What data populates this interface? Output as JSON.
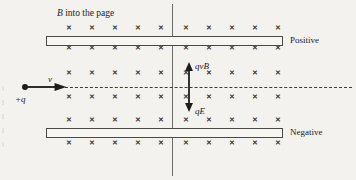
{
  "figure": {
    "background_color": "#f3f2ef",
    "ink_color": "#1d1d1b"
  },
  "labels": {
    "field_prefix": "B",
    "field_suffix": " into the page",
    "field_full": "B into the page",
    "top_plate": "Positive",
    "bottom_plate": "Negative",
    "velocity": "v",
    "charge": "+q",
    "magnetic_force": "qvB",
    "electric_force": "qE"
  },
  "field_marks": {
    "glyph": "✕",
    "symbol_name": "x-into-page-mark",
    "columns": 10,
    "rows": 6,
    "row_y": [
      28,
      48,
      73,
      97,
      120,
      143
    ],
    "column_x": [
      69,
      92,
      115,
      138,
      161,
      186,
      209,
      232,
      255,
      278
    ],
    "gap_after_column": 5
  },
  "plates": {
    "top": {
      "x": 46,
      "y": 36,
      "width": 237,
      "height": 10
    },
    "bottom": {
      "x": 46,
      "y": 128,
      "width": 237,
      "height": 10
    }
  },
  "axis": {
    "x": 172,
    "y_top": 4,
    "y_bottom": 176
  },
  "trajectory": {
    "y": 87,
    "x_start": 60,
    "x_end": 352,
    "style": "dashed"
  },
  "charge_particle": {
    "x": 25,
    "y": 87
  },
  "velocity_arrow": {
    "x_start": 26,
    "x_end": 68,
    "y": 87,
    "direction": "right"
  },
  "force_arrows": [
    {
      "name": "magnetic",
      "x": 189,
      "y_start": 87,
      "y_end": 62,
      "direction": "up",
      "label": "qvB"
    },
    {
      "name": "electric",
      "x": 189,
      "y_start": 87,
      "y_end": 112,
      "direction": "down",
      "label": "qE"
    }
  ],
  "label_positions": {
    "field": {
      "x": 57,
      "y": 9
    },
    "top_plate": {
      "x": 290,
      "y": 36
    },
    "bottom_plate": {
      "x": 290,
      "y": 128
    },
    "velocity": {
      "x": 48,
      "y": 75
    },
    "charge": {
      "x": 15,
      "y": 95
    },
    "magnetic_force": {
      "x": 195,
      "y": 62
    },
    "electric_force": {
      "x": 195,
      "y": 107
    }
  }
}
